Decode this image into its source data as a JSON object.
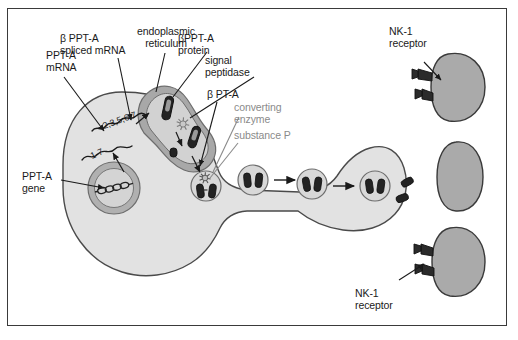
{
  "figure": {
    "border_color": "#3a3a3a",
    "background": "#ffffff"
  },
  "palette": {
    "cytoplasm": "#e2e2e2",
    "organelle": "#b3b3b3",
    "nucleus": "#b0b0b0",
    "vesicle_fill": "#d8d8d8",
    "peptide_dark": "#2b2b2b",
    "outline": "#4a4a4a",
    "gray_text": "#8a8a8a",
    "black_text": "#1a1a1a"
  },
  "labels": {
    "ppt_a_mrna": "PPT-A\nmRNA",
    "beta_ppt_a_spliced_mrna": "β PPT-A\nspliced mRNA",
    "endoplasmic_reticulum": "endoplasmic\nreticulum",
    "beta_ppt_a_protein": "βPPT-A\nprotein",
    "signal_peptidase": "signal\npeptidase",
    "beta_pt_a": "β PT-A",
    "converting_enzyme": "converting\nenzyme",
    "substance_p": "substance P",
    "ppt_a_gene": "PPT-A\ngene",
    "nk1_receptor_top": "NK-1\nreceptor",
    "nk1_receptor_bottom": "NK-1\nreceptor"
  },
  "transcripts": {
    "spliced_exons": "2,3,5,6,7",
    "full_exons": "1-7"
  },
  "structures": {
    "soma": "neuronal cell body",
    "nucleus": "nucleus containing PPT-A gene DNA helix",
    "er": "rough endoplasmic reticulum",
    "axon": "axon with narrow waist",
    "terminal": "presynaptic nerve terminal",
    "vesicle_count": 4,
    "released_peptides": 2,
    "target_cells": 3,
    "receptor_cells_with_nk1": 2
  },
  "icons": {
    "arrow": "arrow-icon",
    "starburst": "enzyme-starburst-icon",
    "dna_helix": "dna-helix-icon",
    "mrna_squiggle": "mrna-squiggle-icon",
    "peptide_capsule": "peptide-capsule-icon",
    "receptor_prong": "receptor-prong-icon"
  }
}
